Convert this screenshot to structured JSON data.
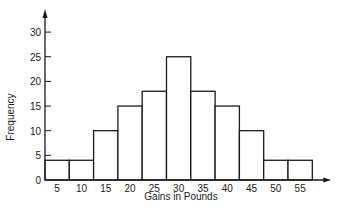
{
  "chart_data": {
    "type": "bar",
    "subtype": "histogram",
    "title": "",
    "xlabel": "Gains in Pounds",
    "ylabel": "Frequency",
    "categories": [
      "5",
      "10",
      "15",
      "20",
      "25",
      "30",
      "35",
      "40",
      "45",
      "50",
      "55"
    ],
    "values": [
      4,
      4,
      10,
      15,
      18,
      25,
      18,
      15,
      10,
      4,
      4
    ],
    "yticks": [
      0,
      5,
      10,
      15,
      20,
      25,
      30
    ],
    "ylim": [
      0,
      33
    ],
    "grid": false,
    "legend": null
  },
  "colors": {
    "stroke": "#1a1a1a",
    "fill": "#ffffff"
  }
}
